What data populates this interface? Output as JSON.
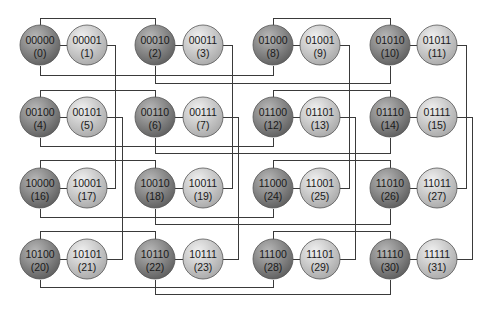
{
  "diagram": {
    "type": "5-dimensional hypercube network (32 nodes)",
    "colors": {
      "even_node_light": "#b8b8b8",
      "even_node_dark": "#5e5e5e",
      "odd_node_light": "#f0f0f0",
      "odd_node_dark": "#a8a8a8",
      "edge": "#3a3a3a"
    },
    "node_radius": 20,
    "nodes": [
      {
        "id": 0,
        "bits": "00000",
        "label": "(0)",
        "x": 40,
        "y": 45,
        "kind": "even"
      },
      {
        "id": 1,
        "bits": "00001",
        "label": "(1)",
        "x": 87,
        "y": 45,
        "kind": "odd"
      },
      {
        "id": 2,
        "bits": "00010",
        "label": "(2)",
        "x": 155,
        "y": 45,
        "kind": "even"
      },
      {
        "id": 3,
        "bits": "00011",
        "label": "(3)",
        "x": 203,
        "y": 45,
        "kind": "odd"
      },
      {
        "id": 8,
        "bits": "01000",
        "label": "(8)",
        "x": 273,
        "y": 45,
        "kind": "even"
      },
      {
        "id": 9,
        "bits": "01001",
        "label": "(9)",
        "x": 320,
        "y": 45,
        "kind": "odd"
      },
      {
        "id": 10,
        "bits": "01010",
        "label": "(10)",
        "x": 390,
        "y": 45,
        "kind": "even"
      },
      {
        "id": 11,
        "bits": "01011",
        "label": "(11)",
        "x": 437,
        "y": 45,
        "kind": "odd"
      },
      {
        "id": 4,
        "bits": "00100",
        "label": "(4)",
        "x": 40,
        "y": 117,
        "kind": "even"
      },
      {
        "id": 5,
        "bits": "00101",
        "label": "(5)",
        "x": 87,
        "y": 117,
        "kind": "odd"
      },
      {
        "id": 6,
        "bits": "00110",
        "label": "(6)",
        "x": 155,
        "y": 117,
        "kind": "even"
      },
      {
        "id": 7,
        "bits": "00111",
        "label": "(7)",
        "x": 203,
        "y": 117,
        "kind": "odd"
      },
      {
        "id": 12,
        "bits": "01100",
        "label": "(12)",
        "x": 273,
        "y": 117,
        "kind": "even"
      },
      {
        "id": 13,
        "bits": "01101",
        "label": "(13)",
        "x": 320,
        "y": 117,
        "kind": "odd"
      },
      {
        "id": 14,
        "bits": "01110",
        "label": "(14)",
        "x": 390,
        "y": 117,
        "kind": "even"
      },
      {
        "id": 15,
        "bits": "01111",
        "label": "(15)",
        "x": 437,
        "y": 117,
        "kind": "odd"
      },
      {
        "id": 16,
        "bits": "10000",
        "label": "(16)",
        "x": 40,
        "y": 188,
        "kind": "even"
      },
      {
        "id": 17,
        "bits": "10001",
        "label": "(17)",
        "x": 87,
        "y": 188,
        "kind": "odd"
      },
      {
        "id": 18,
        "bits": "10010",
        "label": "(18)",
        "x": 155,
        "y": 188,
        "kind": "even"
      },
      {
        "id": 19,
        "bits": "10011",
        "label": "(19)",
        "x": 203,
        "y": 188,
        "kind": "odd"
      },
      {
        "id": 24,
        "bits": "11000",
        "label": "(24)",
        "x": 273,
        "y": 188,
        "kind": "even"
      },
      {
        "id": 25,
        "bits": "11001",
        "label": "(25)",
        "x": 320,
        "y": 188,
        "kind": "odd"
      },
      {
        "id": 26,
        "bits": "11010",
        "label": "(26)",
        "x": 390,
        "y": 188,
        "kind": "even"
      },
      {
        "id": 27,
        "bits": "11011",
        "label": "(27)",
        "x": 437,
        "y": 188,
        "kind": "odd"
      },
      {
        "id": 20,
        "bits": "10100",
        "label": "(20)",
        "x": 40,
        "y": 259,
        "kind": "even"
      },
      {
        "id": 21,
        "bits": "10101",
        "label": "(21)",
        "x": 87,
        "y": 259,
        "kind": "odd"
      },
      {
        "id": 22,
        "bits": "10110",
        "label": "(22)",
        "x": 155,
        "y": 259,
        "kind": "even"
      },
      {
        "id": 23,
        "bits": "10111",
        "label": "(23)",
        "x": 203,
        "y": 259,
        "kind": "odd"
      },
      {
        "id": 28,
        "bits": "11100",
        "label": "(28)",
        "x": 273,
        "y": 259,
        "kind": "even"
      },
      {
        "id": 29,
        "bits": "11101",
        "label": "(29)",
        "x": 320,
        "y": 259,
        "kind": "odd"
      },
      {
        "id": 30,
        "bits": "11110",
        "label": "(30)",
        "x": 390,
        "y": 259,
        "kind": "even"
      },
      {
        "id": 31,
        "bits": "11111",
        "label": "(31)",
        "x": 437,
        "y": 259,
        "kind": "odd"
      }
    ],
    "edges": [
      {
        "from": 0,
        "to": 1,
        "dim": 0,
        "path": [
          [
            60,
            45
          ],
          [
            67,
            45
          ]
        ]
      },
      {
        "from": 2,
        "to": 3,
        "dim": 0,
        "path": [
          [
            175,
            45
          ],
          [
            183,
            45
          ]
        ]
      },
      {
        "from": 8,
        "to": 9,
        "dim": 0,
        "path": [
          [
            293,
            45
          ],
          [
            300,
            45
          ]
        ]
      },
      {
        "from": 10,
        "to": 11,
        "dim": 0,
        "path": [
          [
            410,
            45
          ],
          [
            417,
            45
          ]
        ]
      },
      {
        "from": 4,
        "to": 5,
        "dim": 0,
        "path": [
          [
            60,
            117
          ],
          [
            67,
            117
          ]
        ]
      },
      {
        "from": 6,
        "to": 7,
        "dim": 0,
        "path": [
          [
            175,
            117
          ],
          [
            183,
            117
          ]
        ]
      },
      {
        "from": 12,
        "to": 13,
        "dim": 0,
        "path": [
          [
            293,
            117
          ],
          [
            300,
            117
          ]
        ]
      },
      {
        "from": 14,
        "to": 15,
        "dim": 0,
        "path": [
          [
            410,
            117
          ],
          [
            417,
            117
          ]
        ]
      },
      {
        "from": 16,
        "to": 17,
        "dim": 0,
        "path": [
          [
            60,
            188
          ],
          [
            67,
            188
          ]
        ]
      },
      {
        "from": 18,
        "to": 19,
        "dim": 0,
        "path": [
          [
            175,
            188
          ],
          [
            183,
            188
          ]
        ]
      },
      {
        "from": 24,
        "to": 25,
        "dim": 0,
        "path": [
          [
            293,
            188
          ],
          [
            300,
            188
          ]
        ]
      },
      {
        "from": 26,
        "to": 27,
        "dim": 0,
        "path": [
          [
            410,
            188
          ],
          [
            417,
            188
          ]
        ]
      },
      {
        "from": 20,
        "to": 21,
        "dim": 0,
        "path": [
          [
            60,
            259
          ],
          [
            67,
            259
          ]
        ]
      },
      {
        "from": 22,
        "to": 23,
        "dim": 0,
        "path": [
          [
            175,
            259
          ],
          [
            183,
            259
          ]
        ]
      },
      {
        "from": 28,
        "to": 29,
        "dim": 0,
        "path": [
          [
            293,
            259
          ],
          [
            300,
            259
          ]
        ]
      },
      {
        "from": 30,
        "to": 31,
        "dim": 0,
        "path": [
          [
            410,
            259
          ],
          [
            417,
            259
          ]
        ]
      },
      {
        "from": 0,
        "to": 2,
        "dim": 1,
        "path": [
          [
            40,
            25
          ],
          [
            40,
            18
          ],
          [
            155,
            18
          ],
          [
            155,
            25
          ]
        ]
      },
      {
        "from": 8,
        "to": 10,
        "dim": 1,
        "path": [
          [
            273,
            25
          ],
          [
            273,
            18
          ],
          [
            390,
            18
          ],
          [
            390,
            25
          ]
        ]
      },
      {
        "from": 4,
        "to": 6,
        "dim": 1,
        "path": [
          [
            40,
            97
          ],
          [
            40,
            90
          ],
          [
            155,
            90
          ],
          [
            155,
            97
          ]
        ]
      },
      {
        "from": 12,
        "to": 14,
        "dim": 1,
        "path": [
          [
            273,
            97
          ],
          [
            273,
            90
          ],
          [
            390,
            90
          ],
          [
            390,
            97
          ]
        ]
      },
      {
        "from": 16,
        "to": 18,
        "dim": 1,
        "path": [
          [
            40,
            168
          ],
          [
            40,
            160
          ],
          [
            155,
            160
          ],
          [
            155,
            168
          ]
        ]
      },
      {
        "from": 24,
        "to": 26,
        "dim": 1,
        "path": [
          [
            273,
            168
          ],
          [
            273,
            160
          ],
          [
            390,
            160
          ],
          [
            390,
            168
          ]
        ]
      },
      {
        "from": 20,
        "to": 22,
        "dim": 1,
        "path": [
          [
            40,
            239
          ],
          [
            40,
            231
          ],
          [
            155,
            231
          ],
          [
            155,
            239
          ]
        ]
      },
      {
        "from": 28,
        "to": 30,
        "dim": 1,
        "path": [
          [
            273,
            239
          ],
          [
            273,
            231
          ],
          [
            390,
            231
          ],
          [
            390,
            239
          ]
        ]
      },
      {
        "from": 0,
        "to": 8,
        "dim": 3,
        "path": [
          [
            40,
            65
          ],
          [
            40,
            75
          ],
          [
            273,
            75
          ],
          [
            273,
            65
          ]
        ]
      },
      {
        "from": 2,
        "to": 10,
        "dim": 3,
        "path": [
          [
            155,
            65
          ],
          [
            155,
            83
          ],
          [
            390,
            83
          ],
          [
            390,
            65
          ]
        ]
      },
      {
        "from": 4,
        "to": 12,
        "dim": 3,
        "path": [
          [
            40,
            137
          ],
          [
            40,
            146
          ],
          [
            273,
            146
          ],
          [
            273,
            137
          ]
        ]
      },
      {
        "from": 6,
        "to": 14,
        "dim": 3,
        "path": [
          [
            155,
            137
          ],
          [
            155,
            153
          ],
          [
            390,
            153
          ],
          [
            390,
            137
          ]
        ]
      },
      {
        "from": 16,
        "to": 24,
        "dim": 3,
        "path": [
          [
            40,
            208
          ],
          [
            40,
            217
          ],
          [
            273,
            217
          ],
          [
            273,
            208
          ]
        ]
      },
      {
        "from": 18,
        "to": 26,
        "dim": 3,
        "path": [
          [
            155,
            208
          ],
          [
            155,
            224
          ],
          [
            390,
            224
          ],
          [
            390,
            208
          ]
        ]
      },
      {
        "from": 20,
        "to": 28,
        "dim": 3,
        "path": [
          [
            40,
            279
          ],
          [
            40,
            287
          ],
          [
            273,
            287
          ],
          [
            273,
            279
          ]
        ]
      },
      {
        "from": 22,
        "to": 30,
        "dim": 3,
        "path": [
          [
            155,
            279
          ],
          [
            155,
            294
          ],
          [
            390,
            294
          ],
          [
            390,
            279
          ]
        ]
      },
      {
        "from": 1,
        "to": 17,
        "dim": 4,
        "path": [
          [
            107,
            45
          ],
          [
            115,
            45
          ],
          [
            115,
            188
          ],
          [
            107,
            188
          ]
        ]
      },
      {
        "from": 5,
        "to": 21,
        "dim": 4,
        "path": [
          [
            107,
            117
          ],
          [
            122,
            117
          ],
          [
            122,
            259
          ],
          [
            107,
            259
          ]
        ]
      },
      {
        "from": 3,
        "to": 19,
        "dim": 4,
        "path": [
          [
            223,
            45
          ],
          [
            232,
            45
          ],
          [
            232,
            188
          ],
          [
            223,
            188
          ]
        ]
      },
      {
        "from": 7,
        "to": 23,
        "dim": 4,
        "path": [
          [
            223,
            117
          ],
          [
            238,
            117
          ],
          [
            238,
            259
          ],
          [
            223,
            259
          ]
        ]
      },
      {
        "from": 9,
        "to": 25,
        "dim": 4,
        "path": [
          [
            340,
            45
          ],
          [
            349,
            45
          ],
          [
            349,
            188
          ],
          [
            340,
            188
          ]
        ]
      },
      {
        "from": 13,
        "to": 29,
        "dim": 4,
        "path": [
          [
            340,
            117
          ],
          [
            355,
            117
          ],
          [
            355,
            259
          ],
          [
            340,
            259
          ]
        ]
      },
      {
        "from": 11,
        "to": 27,
        "dim": 4,
        "path": [
          [
            457,
            45
          ],
          [
            466,
            45
          ],
          [
            466,
            188
          ],
          [
            457,
            188
          ]
        ]
      },
      {
        "from": 15,
        "to": 31,
        "dim": 4,
        "path": [
          [
            457,
            117
          ],
          [
            472,
            117
          ],
          [
            472,
            259
          ],
          [
            457,
            259
          ]
        ]
      }
    ]
  }
}
